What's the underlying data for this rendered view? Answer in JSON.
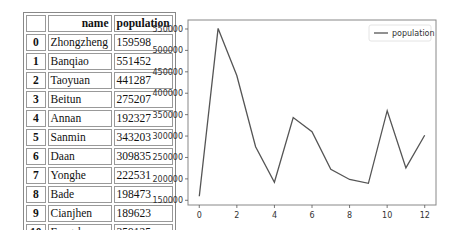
{
  "table": {
    "columns": [
      "",
      "name",
      "population"
    ],
    "rows": [
      {
        "index": "0",
        "name": "Zhongzheng",
        "population": "159598"
      },
      {
        "index": "1",
        "name": "Banqiao",
        "population": "551452"
      },
      {
        "index": "2",
        "name": "Taoyuan",
        "population": "441287"
      },
      {
        "index": "3",
        "name": "Beitun",
        "population": "275207"
      },
      {
        "index": "4",
        "name": "Annan",
        "population": "192327"
      },
      {
        "index": "5",
        "name": "Sanmin",
        "population": "343203"
      },
      {
        "index": "6",
        "name": "Daan",
        "population": "309835"
      },
      {
        "index": "7",
        "name": "Yonghe",
        "population": "222531"
      },
      {
        "index": "8",
        "name": "Bade",
        "population": "198473"
      },
      {
        "index": "9",
        "name": "Cianjhen",
        "population": "189623"
      },
      {
        "index": "10",
        "name": "Fengshan",
        "population": "359125"
      },
      {
        "index": "11",
        "name": "Xinyi",
        "population": "225561"
      },
      {
        "index": "12",
        "name": "Xindian",
        "population": "302070"
      }
    ]
  },
  "chart_data": {
    "type": "line",
    "title": "",
    "xlabel": "",
    "ylabel": "",
    "x": [
      0,
      1,
      2,
      3,
      4,
      5,
      6,
      7,
      8,
      9,
      10,
      11,
      12
    ],
    "series": [
      {
        "name": "population",
        "color": "#555555",
        "values": [
          159598,
          551452,
          441287,
          275207,
          192327,
          343203,
          309835,
          222531,
          198473,
          189623,
          359125,
          225561,
          302070
        ]
      }
    ],
    "xticks": [
      "0",
      "2",
      "4",
      "6",
      "8",
      "10",
      "12"
    ],
    "yticks": [
      "150000",
      "200000",
      "250000",
      "300000",
      "350000",
      "400000",
      "450000",
      "500000",
      "550000"
    ],
    "xlim": [
      -0.6,
      12.6
    ],
    "ylim": [
      139000,
      571000
    ],
    "grid": false,
    "legend_position": "upper right"
  }
}
